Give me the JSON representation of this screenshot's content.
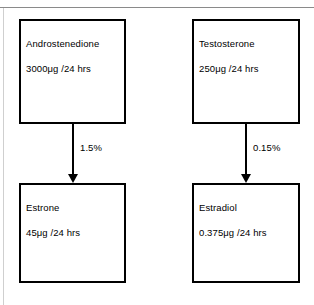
{
  "figure": {
    "background_color": "#ffffff",
    "line_color": "#000000",
    "rule_color": "#8a8a8a"
  },
  "nodes": [
    {
      "id": "androstenedione",
      "title": "Androstenedione",
      "value": "3000μg /24 hrs"
    },
    {
      "id": "testosterone",
      "title": "Testosterone",
      "value": "250μg /24 hrs"
    },
    {
      "id": "estrone",
      "title": "Estrone",
      "value": "45μg /24 hrs"
    },
    {
      "id": "estradiol",
      "title": "Estradiol",
      "value": "0.375μg /24 hrs"
    }
  ],
  "edges": [
    {
      "id": "androstenedione-to-estrone",
      "from": "androstenedione",
      "to": "estrone",
      "label": "1.5%"
    },
    {
      "id": "testosterone-to-estradiol",
      "from": "testosterone",
      "to": "estradiol",
      "label": "0.15%"
    }
  ],
  "chart_data": {
    "type": "diagram",
    "title": "",
    "nodes": [
      {
        "label": "Androstenedione",
        "amount": 3000,
        "unit": "μg/24 hrs"
      },
      {
        "label": "Testosterone",
        "amount": 250,
        "unit": "μg/24 hrs"
      },
      {
        "label": "Estrone",
        "amount": 45,
        "unit": "μg/24 hrs"
      },
      {
        "label": "Estradiol",
        "amount": 0.375,
        "unit": "μg/24 hrs"
      }
    ],
    "edges": [
      {
        "source": "Androstenedione",
        "target": "Estrone",
        "conversion": "1.5%"
      },
      {
        "source": "Testosterone",
        "target": "Estradiol",
        "conversion": "0.15%"
      }
    ]
  }
}
